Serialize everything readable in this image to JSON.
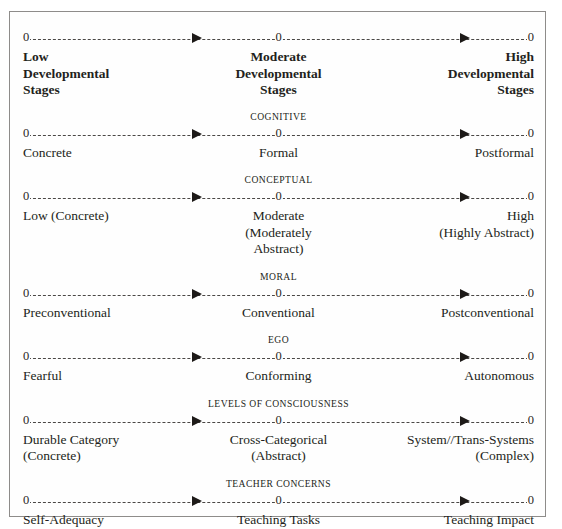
{
  "figure": {
    "name": "developmental-stages-continuum-chart",
    "axis": {
      "node_marker": "0",
      "arrow_glyph": "arrowhead-right-icon",
      "line_style": "dashed"
    },
    "header_row": {
      "left": [
        "Low",
        "Developmental",
        "Stages"
      ],
      "mid": [
        "Moderate",
        "Developmental",
        "Stages"
      ],
      "right": [
        "High",
        "Developmental",
        "Stages"
      ]
    },
    "sections": [
      {
        "title": "COGNITIVE",
        "left": [
          "Concrete"
        ],
        "mid": [
          "Formal"
        ],
        "right": [
          "Postformal"
        ]
      },
      {
        "title": "CONCEPTUAL",
        "left": [
          "Low (Concrete)"
        ],
        "mid": [
          "Moderate",
          "(Moderately",
          "Abstract)"
        ],
        "right": [
          "High",
          "(Highly Abstract)"
        ]
      },
      {
        "title": "MORAL",
        "left": [
          "Preconventional"
        ],
        "mid": [
          "Conventional"
        ],
        "right": [
          "Postconventional"
        ]
      },
      {
        "title": "EGO",
        "left": [
          "Fearful"
        ],
        "mid": [
          "Conforming"
        ],
        "right": [
          "Autonomous"
        ]
      },
      {
        "title": "LEVELS OF CONSCIOUSNESS",
        "left": [
          "Durable Category",
          "(Concrete)"
        ],
        "mid": [
          "Cross-Categorical",
          "(Abstract)"
        ],
        "right": [
          "System//Trans-Systems",
          "(Complex)"
        ]
      },
      {
        "title": "TEACHER CONCERNS",
        "left": [
          "Self-Adequacy"
        ],
        "mid": [
          "Teaching Tasks"
        ],
        "right": [
          "Teaching Impact"
        ]
      }
    ],
    "colors": {
      "border": "#8e8c8a",
      "text": "#231f20",
      "line": "#4a4745",
      "background": "#fefefe"
    }
  }
}
